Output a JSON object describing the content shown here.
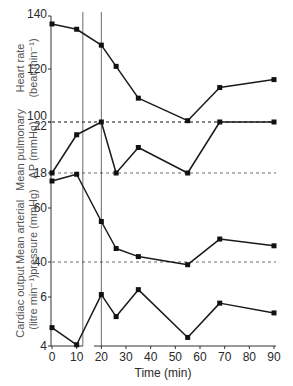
{
  "chart_data": {
    "type": "line",
    "title": "",
    "xlabel": "Time (min)",
    "xlim": [
      0,
      90
    ],
    "x_ticks": [
      0,
      10,
      20,
      30,
      40,
      50,
      60,
      70,
      80,
      90
    ],
    "x": [
      0,
      10,
      20,
      26,
      35,
      55,
      68,
      90
    ],
    "vertical_reference_lines_min": [
      12.5,
      20
    ],
    "grid": false,
    "legend": null,
    "panels": [
      {
        "name": "heart_rate",
        "ylabel": "Heart rate (beat min⁻¹)",
        "ylabel_line1": "Heart rate",
        "ylabel_line2": "(beat min⁻¹)",
        "y_ticks": [
          100,
          120,
          140
        ],
        "ylim": [
          100,
          140
        ],
        "reference_line": 100,
        "values": [
          137,
          135,
          129,
          121,
          109,
          100.5,
          113,
          116
        ]
      },
      {
        "name": "mean_pulmonary_ap",
        "ylabel": "Mean pulmonary AP (mmHg)",
        "ylabel_line1": "Mean pulmonary",
        "ylabel_line2": "AP (mmHg)",
        "y_ticks": [
          18,
          22
        ],
        "ylim": [
          18,
          22
        ],
        "reference_lines": [
          18,
          22
        ],
        "values": [
          18,
          21,
          22,
          18,
          20,
          18,
          22,
          22
        ]
      },
      {
        "name": "mean_arterial_pressure",
        "ylabel": "Mean arterial pressure (mmHg)",
        "ylabel_line1": "Mean arterial",
        "ylabel_line2": "pressure (mmHg)",
        "y_ticks": [
          40,
          60
        ],
        "ylim": [
          40,
          60
        ],
        "reference_line": 40,
        "values": [
          70,
          72.5,
          55,
          45,
          42,
          39,
          48.5,
          46
        ]
      },
      {
        "name": "cardiac_output",
        "ylabel": "Cardiac output (litre min⁻¹)",
        "ylabel_line1": "Cardiac output",
        "ylabel_line2": "(litre min⁻¹)",
        "y_ticks": [
          4,
          6
        ],
        "ylim": [
          4,
          6
        ],
        "values": [
          4.75,
          4.05,
          6.1,
          5.2,
          6.3,
          4.35,
          5.75,
          5.35
        ]
      }
    ]
  },
  "layout": {
    "x0_px": 52,
    "x90_px": 274,
    "axis_top_px": 16,
    "axis_bottom_px": 346,
    "vline_top_px": 12,
    "ref_right_px": 276,
    "axis_gap_min": [
      12.5,
      17
    ],
    "panel_scales": [
      {
        "v1": 140,
        "y1": 16,
        "v2": 100,
        "y2": 122
      },
      {
        "v1": 22,
        "y1": 122,
        "v2": 18,
        "y2": 173
      },
      {
        "v1": 60,
        "y1": 208,
        "v2": 40,
        "y2": 262
      },
      {
        "v1": 6,
        "y1": 297,
        "v2": 4,
        "y2": 346
      }
    ],
    "tick_label_positions": [
      {
        "panel": 0,
        "value": 140,
        "label": "140",
        "dy": -2
      },
      {
        "panel": 0,
        "value": 120,
        "label": "120",
        "dy": 0
      },
      {
        "panel": 0,
        "value": 100,
        "label": "100",
        "dy": -6
      },
      {
        "panel": 1,
        "value": 22,
        "label": "22",
        "dy": 4
      },
      {
        "panel": 1,
        "value": 18,
        "label": "18",
        "dy": 0
      },
      {
        "panel": 2,
        "value": 60,
        "label": "60",
        "dy": 0
      },
      {
        "panel": 2,
        "value": 40,
        "label": "40",
        "dy": 0
      },
      {
        "panel": 3,
        "value": 6,
        "label": "6",
        "dy": 0
      },
      {
        "panel": 3,
        "value": 4,
        "label": "4",
        "dy": 0
      }
    ],
    "ylabel_positions": [
      {
        "panel": 0,
        "cx": 28,
        "cy": 68
      },
      {
        "panel": 1,
        "cx": 28,
        "cy": 150
      },
      {
        "panel": 2,
        "cx": 28,
        "cy": 232
      },
      {
        "panel": 3,
        "cx": 28,
        "cy": 302
      }
    ]
  }
}
